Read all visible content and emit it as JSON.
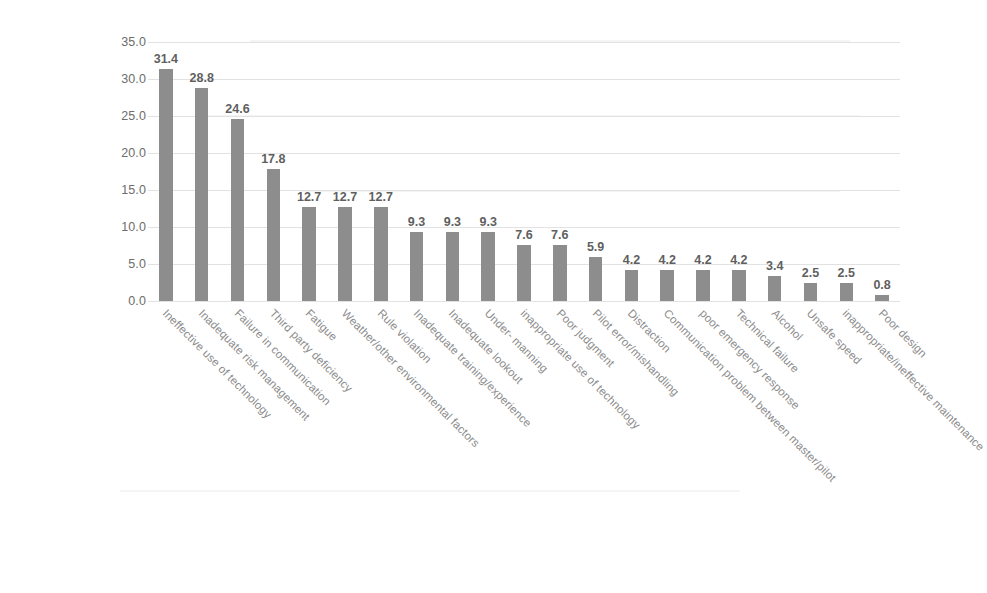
{
  "chart_data": {
    "type": "bar",
    "title": "",
    "subtitle": "",
    "xlabel": "",
    "ylabel": "",
    "ylim": [
      0.0,
      35.0
    ],
    "yticks": [
      "35.0",
      "30.0",
      "25.0",
      "20.0",
      "15.0",
      "10.0",
      "5.0",
      "0.0"
    ],
    "ytick_values": [
      35.0,
      30.0,
      25.0,
      20.0,
      15.0,
      10.0,
      5.0,
      0.0
    ],
    "grid": true,
    "legend": false,
    "legend_position": "none",
    "bar_color": "#8d8d8d",
    "data_label_color": "#5f5f5f",
    "axis_text_color": "#6d6d6d",
    "categories": [
      "Ineffective use of technology",
      "Inadequate risk management",
      "Failure in communication",
      "Third party deficiency",
      "Fatigue",
      "Weather/other environmental factors",
      "Rule violation",
      "Inadequate training/experience",
      "Inadequate lookout",
      "Under- manning",
      "inappropriate use of technology",
      "Poor judgment",
      "Pilot error/mishandling",
      "Distraction",
      "Communication problem between master/pilot",
      "poor emergency response",
      "Technical failure",
      "Alcohol",
      "Unsafe speed",
      "inappropriate/ineffective maintenance",
      "Poor design"
    ],
    "values": [
      31.4,
      28.8,
      24.6,
      17.8,
      12.7,
      12.7,
      12.7,
      9.3,
      9.3,
      9.3,
      7.6,
      7.6,
      5.9,
      4.2,
      4.2,
      4.2,
      4.2,
      3.4,
      2.5,
      2.5,
      0.8
    ],
    "value_labels": [
      "31.4",
      "28.8",
      "24.6",
      "17.8",
      "12.7",
      "12.7",
      "12.7",
      "9.3",
      "9.3",
      "9.3",
      "7.6",
      "7.6",
      "5.9",
      "4.2",
      "4.2",
      "4.2",
      "4.2",
      "3.4",
      "2.5",
      "2.5",
      "0.8"
    ]
  }
}
